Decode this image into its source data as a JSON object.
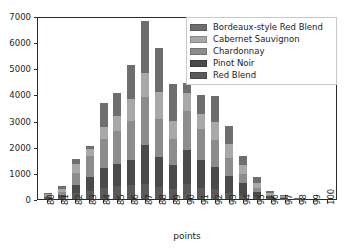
{
  "chart_data": {
    "type": "bar",
    "stacked": true,
    "title": "",
    "xlabel": "points",
    "ylabel": "",
    "categories": [
      "80",
      "81",
      "82",
      "83",
      "84",
      "85",
      "86",
      "87",
      "88",
      "89",
      "90",
      "91",
      "92",
      "93",
      "94",
      "95",
      "96",
      "97",
      "98",
      "99",
      "100"
    ],
    "ylim": [
      0,
      7000
    ],
    "yticks": [
      0,
      1000,
      2000,
      3000,
      4000,
      5000,
      6000,
      7000
    ],
    "grid": false,
    "legend_position": "upper right",
    "series": [
      {
        "name": "Red Blend",
        "color": "#5a5a5a",
        "values": [
          60,
          90,
          240,
          300,
          430,
          480,
          520,
          560,
          470,
          400,
          560,
          420,
          370,
          240,
          170,
          60,
          25,
          8,
          2,
          0,
          0
        ]
      },
      {
        "name": "Pinot Noir",
        "color": "#4a4a4a",
        "values": [
          30,
          60,
          280,
          560,
          740,
          860,
          990,
          1520,
          1140,
          920,
          1320,
          1070,
          840,
          640,
          430,
          210,
          75,
          30,
          5,
          0,
          0
        ]
      },
      {
        "name": "Chardonnay",
        "color": "#8c8c8c",
        "values": [
          50,
          130,
          480,
          800,
          1140,
          1260,
          1490,
          1820,
          1440,
          970,
          1480,
          1170,
          1040,
          700,
          370,
          150,
          60,
          25,
          4,
          0,
          0
        ]
      },
      {
        "name": "Cabernet Sauvignon",
        "color": "#a8a8a8",
        "values": [
          40,
          110,
          330,
          270,
          460,
          570,
          810,
          940,
          1030,
          690,
          690,
          590,
          680,
          540,
          330,
          180,
          70,
          40,
          6,
          0,
          0
        ]
      },
      {
        "name": "Bordeaux-style Red Blend",
        "color": "#6e6e6e",
        "values": [
          40,
          120,
          220,
          100,
          890,
          880,
          1310,
          1980,
          1690,
          1410,
          400,
          730,
          1020,
          660,
          360,
          240,
          95,
          50,
          8,
          0,
          0
        ]
      }
    ],
    "totals": [
      220,
      510,
      1550,
      2030,
      3660,
      4050,
      5120,
      6820,
      5770,
      4390,
      4450,
      3980,
      3950,
      2780,
      1660,
      840,
      325,
      153,
      25,
      0,
      0
    ]
  },
  "legend": {
    "entries": [
      {
        "label": "Bordeaux-style Red Blend",
        "color": "#6e6e6e"
      },
      {
        "label": "Cabernet Sauvignon",
        "color": "#a8a8a8"
      },
      {
        "label": "Chardonnay",
        "color": "#8c8c8c"
      },
      {
        "label": "Pinot Noir",
        "color": "#4a4a4a"
      },
      {
        "label": "Red Blend",
        "color": "#5a5a5a"
      }
    ]
  }
}
